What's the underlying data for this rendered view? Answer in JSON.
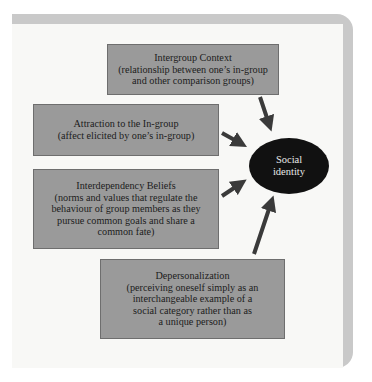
{
  "diagram": {
    "boxes": [
      {
        "id": "intergroup-context",
        "title": "Intergroup Context",
        "lines": [
          "(relationship between one’s in-group",
          "and other comparison groups)"
        ]
      },
      {
        "id": "attraction",
        "title": "Attraction to the In-group",
        "lines": [
          "(affect elicited by one’s in-group)"
        ]
      },
      {
        "id": "interdependency",
        "title": "Interdependency Beliefs",
        "lines": [
          "(norms and values that regulate the",
          "behaviour of group members as they",
          "pursue common goals and share a",
          "common fate)"
        ]
      },
      {
        "id": "depersonalization",
        "title": "Depersonalization",
        "lines": [
          "(perceiving oneself simply as an",
          "interchangeable example of a",
          "social category rather than as",
          "a unique person)"
        ]
      }
    ],
    "center": {
      "lines": [
        "Social",
        "identity"
      ]
    },
    "colors": {
      "box_fill": "#9a9a9a",
      "ellipse_fill": "#111111",
      "arrow": "#3a3a3a",
      "frame": "#c9c9c9"
    }
  }
}
